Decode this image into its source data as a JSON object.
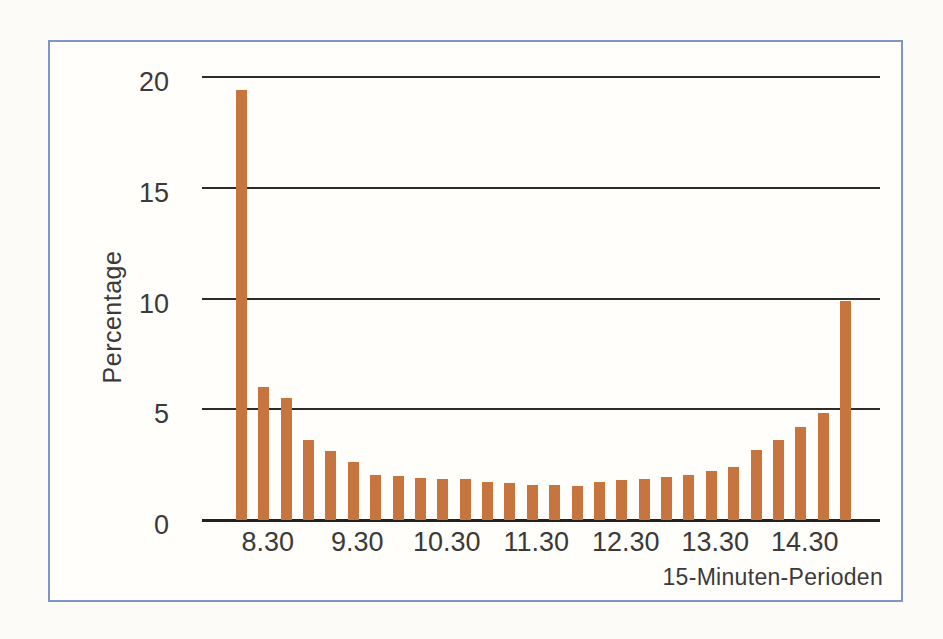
{
  "chart_data": {
    "type": "bar",
    "title": "",
    "xlabel": "15-Minuten-Perioden",
    "ylabel": "Percentage",
    "ylim": [
      0,
      20
    ],
    "y_ticks": [
      0,
      5,
      10,
      15,
      20
    ],
    "x_tick_labels": [
      "8.30",
      "9.30",
      "10.30",
      "11.30",
      "12.30",
      "13.30",
      "14.30"
    ],
    "bars_per_tick_interval": 4,
    "first_labeled_bar_index": 1,
    "grid": "horizontal",
    "legend": "none",
    "values": [
      19.4,
      6.0,
      5.5,
      3.6,
      3.1,
      2.6,
      2.05,
      2.0,
      1.9,
      1.85,
      1.85,
      1.7,
      1.65,
      1.6,
      1.6,
      1.55,
      1.7,
      1.8,
      1.85,
      1.95,
      2.05,
      2.2,
      2.4,
      3.15,
      3.6,
      4.2,
      4.85,
      9.9
    ],
    "colors": {
      "bar": "#c8743e",
      "gridline": "#2e2c29",
      "text": "#3b3a38",
      "frame_border": "#7e96c5",
      "frame_background": "#fffefb",
      "page_background": "#fcfbf8"
    }
  }
}
